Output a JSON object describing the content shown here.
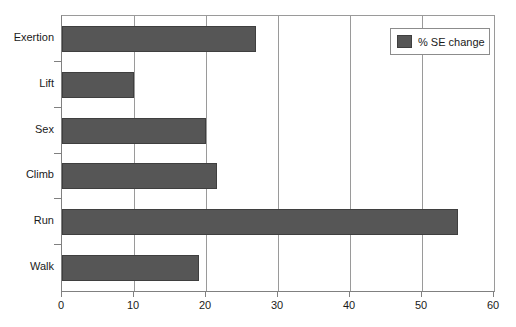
{
  "chart_data": {
    "type": "bar",
    "orientation": "horizontal",
    "title": "",
    "xlabel": "",
    "ylabel": "",
    "categories": [
      "Exertion",
      "Lift",
      "Sex",
      "Climb",
      "Run",
      "Walk"
    ],
    "values": [
      27,
      10,
      20,
      21.5,
      55,
      19
    ],
    "series": [
      {
        "name": "% SE change",
        "values": [
          27,
          10,
          20,
          21.5,
          55,
          19
        ],
        "color": "#565656"
      }
    ],
    "xlim": [
      0,
      60
    ],
    "xticks": [
      0,
      10,
      20,
      30,
      40,
      50,
      60
    ],
    "xtick_labels": [
      "0",
      "10",
      "20",
      "30",
      "40",
      "50",
      "60"
    ],
    "grid": true,
    "grid_axis": "x",
    "legend": {
      "position": "top-right",
      "entries": [
        {
          "label": "% SE change",
          "color": "#565656"
        }
      ]
    }
  },
  "colors": {
    "bar_fill": "#565656",
    "bar_stroke": "#3f3f3f",
    "axis": "#808080",
    "gridline": "#9a9a9a",
    "background": "#ffffff",
    "text": "#1a1a1a"
  }
}
